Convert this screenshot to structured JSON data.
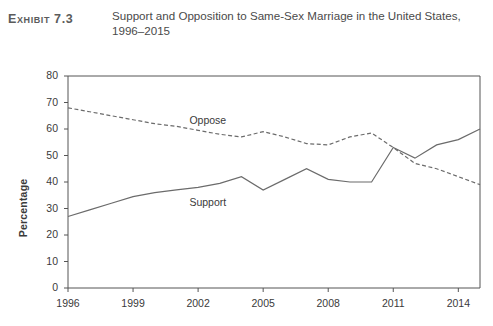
{
  "header": {
    "exhibit_label": "Exhibit 7.3",
    "title": "Support and Opposition to Same-Sex Marriage in the United States, 1996–2015"
  },
  "chart_data": {
    "type": "line",
    "title": "Support and Opposition to Same-Sex Marriage in the United States, 1996–2015",
    "xlabel": "",
    "ylabel": "Percentage",
    "xlim": [
      1996,
      2015
    ],
    "ylim": [
      0,
      80
    ],
    "ytick_values": [
      0,
      10,
      20,
      30,
      40,
      50,
      60,
      70,
      80
    ],
    "xtick_values": [
      1996,
      1999,
      2002,
      2005,
      2008,
      2011,
      2014
    ],
    "grid": false,
    "legend": "inline-labels",
    "x": [
      1996,
      1997,
      1998,
      1999,
      2000,
      2001,
      2002,
      2003,
      2004,
      2005,
      2006,
      2007,
      2008,
      2009,
      2010,
      2011,
      2012,
      2013,
      2014,
      2015
    ],
    "series": [
      {
        "name": "Oppose",
        "style": "dashed",
        "color": "#6b6b6b",
        "label_x": 2001.6,
        "label_y": 63,
        "values": [
          68,
          66.5,
          65,
          63.5,
          62,
          61,
          59.5,
          58,
          57,
          59,
          57,
          54.5,
          54,
          57,
          58.5,
          53,
          47,
          45,
          42,
          39
        ]
      },
      {
        "name": "Support",
        "style": "solid",
        "color": "#6b6b6b",
        "label_x": 2001.6,
        "label_y": 32,
        "values": [
          27,
          29.5,
          32,
          34.5,
          36,
          37,
          38,
          39.5,
          42,
          37,
          41,
          45,
          41,
          40,
          40,
          53,
          49,
          54,
          56,
          60
        ]
      }
    ],
    "annotations": [
      {
        "text": "Oppose",
        "x": 2001.6,
        "y": 63
      },
      {
        "text": "Support",
        "x": 2001.6,
        "y": 32
      }
    ]
  }
}
